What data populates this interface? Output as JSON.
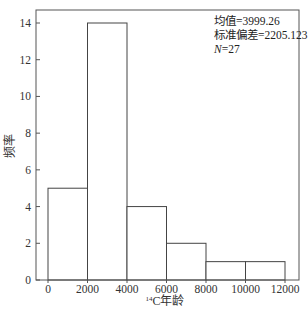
{
  "chart_data": {
    "type": "bar",
    "subtype": "histogram",
    "title": "",
    "xlabel": "14C年龄",
    "xlabel_superscript": "14",
    "xlabel_main": "C年龄",
    "ylabel": "频率",
    "bins": [
      [
        0,
        2000
      ],
      [
        2000,
        4000
      ],
      [
        4000,
        6000
      ],
      [
        6000,
        8000
      ],
      [
        8000,
        10000
      ],
      [
        10000,
        12000
      ]
    ],
    "categories": [
      "0-2000",
      "2000-4000",
      "4000-6000",
      "6000-8000",
      "8000-10000",
      "10000-12000"
    ],
    "values": [
      5,
      14,
      4,
      2,
      1,
      1
    ],
    "xlim": [
      -1200,
      12700
    ],
    "ylim": [
      0,
      14.7
    ],
    "xticks": [
      0,
      2000,
      4000,
      6000,
      8000,
      10000,
      12000
    ],
    "yticks": [
      0,
      2,
      4,
      6,
      8,
      10,
      12,
      14
    ],
    "grid": false,
    "annotations": {
      "mean_label": "均值=3999.26",
      "std_label": "标准偏差=2205.123",
      "n_label_prefix": "N",
      "n_label_value": "=27"
    },
    "bar_fill": "#ffffff",
    "bar_stroke": "#444444"
  }
}
